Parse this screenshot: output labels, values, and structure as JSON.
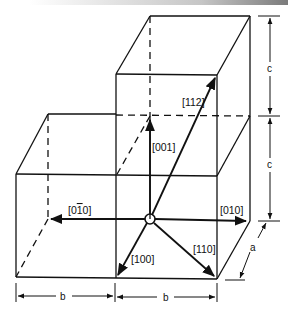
{
  "diagram": {
    "type": "crystal-lattice-unit-cells",
    "vectors": [
      {
        "id": "001",
        "label_indices": [
          "0",
          "0",
          "1"
        ],
        "bars": [
          false,
          false,
          false
        ]
      },
      {
        "id": "112",
        "label_indices": [
          "1",
          "1",
          "2"
        ],
        "bars": [
          false,
          false,
          false
        ]
      },
      {
        "id": "0-10",
        "label_indices": [
          "0",
          "1",
          "0"
        ],
        "bars": [
          false,
          true,
          false
        ]
      },
      {
        "id": "010",
        "label_indices": [
          "0",
          "1",
          "0"
        ],
        "bars": [
          false,
          false,
          false
        ]
      },
      {
        "id": "100",
        "label_indices": [
          "1",
          "0",
          "0"
        ],
        "bars": [
          false,
          false,
          false
        ]
      },
      {
        "id": "110",
        "label_indices": [
          "1",
          "1",
          "0"
        ],
        "bars": [
          false,
          false,
          false
        ]
      }
    ],
    "labels": {
      "v001": "[001]",
      "v112": "[112]",
      "v0m10_open": "[0",
      "v0m10_bar": "1",
      "v0m10_close": "0]",
      "v010": "[010]",
      "v100": "[100]",
      "v110": "[110]"
    },
    "dimensions": {
      "c_upper": "c",
      "c_lower": "c",
      "a": "a",
      "b_left": "b",
      "b_right": "b"
    }
  }
}
